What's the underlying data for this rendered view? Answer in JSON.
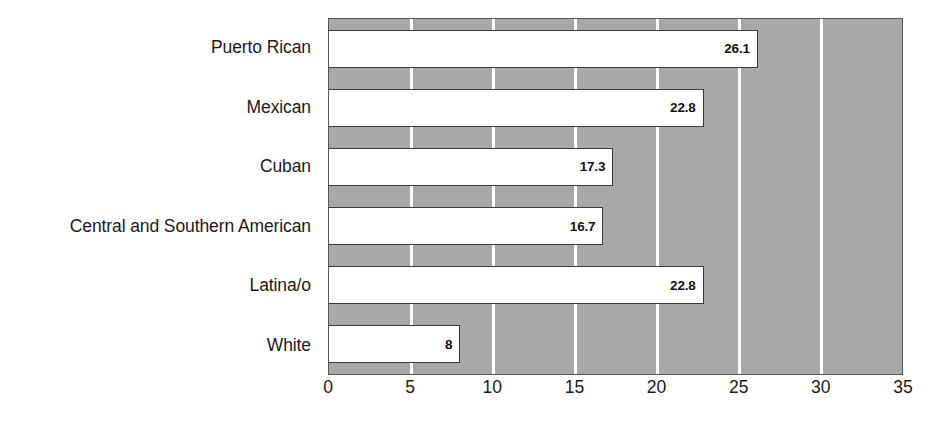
{
  "chart_data": {
    "type": "bar",
    "orientation": "horizontal",
    "title": "",
    "subtitle": "",
    "xlabel": "",
    "ylabel": "",
    "categories": [
      "Puerto Rican",
      "Mexican",
      "Cuban",
      "Central and Southern American",
      "Latina/o",
      "White"
    ],
    "values": [
      26.1,
      22.8,
      17.3,
      16.7,
      22.8,
      8
    ],
    "value_labels": [
      "26.1",
      "22.8",
      "17.3",
      "16.7",
      "22.8",
      "8"
    ],
    "xlim": [
      0,
      35
    ],
    "xticks": [
      0,
      5,
      10,
      15,
      20,
      25,
      30,
      35
    ],
    "xtick_labels": [
      "0",
      "5",
      "10",
      "15",
      "20",
      "25",
      "30",
      "35"
    ],
    "grid": true,
    "grid_axis": "x",
    "legend": false,
    "legend_position": "none",
    "series": [
      {
        "name": "",
        "values": [
          26.1,
          22.8,
          17.3,
          16.7,
          22.8,
          8
        ]
      }
    ]
  },
  "style": {
    "plot_background": "#a8a8a8",
    "gridline_color": "#ffffff",
    "bar_fill": "#ffffff",
    "bar_border": "#3a3a3a",
    "axis_color": "#555555",
    "text_color": "#1a1a1a",
    "page_background": "#ffffff"
  }
}
